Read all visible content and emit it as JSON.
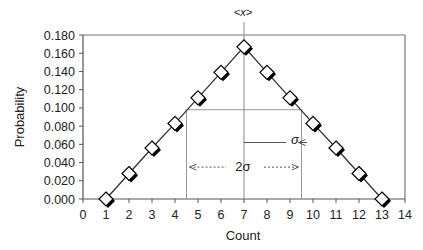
{
  "chart_data": {
    "type": "line",
    "title": "<x>",
    "xlabel": "Count",
    "ylabel": "Probability",
    "xlim": [
      0,
      14
    ],
    "ylim": [
      0,
      0.18
    ],
    "x_ticks": [
      0,
      1,
      2,
      3,
      4,
      5,
      6,
      7,
      8,
      9,
      10,
      11,
      12,
      13,
      14
    ],
    "y_ticks": [
      "0.000",
      "0.020",
      "0.040",
      "0.060",
      "0.080",
      "0.100",
      "0.120",
      "0.140",
      "0.160",
      "0.180"
    ],
    "grid": false,
    "legend": null,
    "series": [
      {
        "name": "Probability",
        "marker": "diamond",
        "x": [
          1,
          2,
          3,
          4,
          5,
          6,
          7,
          8,
          9,
          10,
          11,
          12,
          13
        ],
        "values": [
          0.0,
          0.028,
          0.056,
          0.083,
          0.111,
          0.139,
          0.167,
          0.139,
          0.111,
          0.083,
          0.056,
          0.028,
          0.0
        ]
      }
    ],
    "annotations": [
      {
        "type": "vline",
        "x": 7,
        "label": "<x>",
        "y_top": 0.18
      },
      {
        "type": "box",
        "x0": 4.5,
        "x1": 9.5,
        "y": 0.098
      },
      {
        "type": "arrow",
        "label": "σ",
        "from_x": 7,
        "to_x": 9.5,
        "y": 0.062
      },
      {
        "type": "double-arrow-dashed",
        "label": "2σ",
        "from_x": 4.5,
        "to_x": 9.5,
        "y": 0.035
      }
    ]
  },
  "labels": {
    "mean": "<x>",
    "sigma": "σ",
    "two_sigma": "2σ",
    "xlabel": "Count",
    "ylabel": "Probability"
  }
}
